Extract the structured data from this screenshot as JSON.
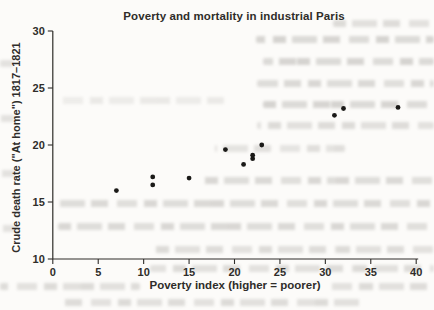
{
  "chart_data": {
    "type": "scatter",
    "title": "Poverty and mortality in industrial Paris",
    "xlabel": "Poverty index (higher = poorer)",
    "ylabel": "Crude death rate (\"At home\") 1817–1821",
    "xlim": [
      0,
      40
    ],
    "ylim": [
      10,
      30
    ],
    "x_ticks": [
      0,
      5,
      10,
      15,
      20,
      25,
      30,
      35,
      40
    ],
    "y_ticks": [
      10,
      15,
      20,
      25,
      30
    ],
    "grid": false,
    "legend": null,
    "marker": "dot",
    "marker_color": "#1b1a18",
    "axis_color": "#2f2d2a",
    "background_color": "#fcfbf9",
    "points": [
      {
        "x": 7,
        "y": 16.0
      },
      {
        "x": 11,
        "y": 16.5
      },
      {
        "x": 11,
        "y": 17.2
      },
      {
        "x": 15,
        "y": 17.1
      },
      {
        "x": 19,
        "y": 19.6
      },
      {
        "x": 21,
        "y": 18.3
      },
      {
        "x": 22,
        "y": 18.8
      },
      {
        "x": 22,
        "y": 19.1
      },
      {
        "x": 23,
        "y": 20.0
      },
      {
        "x": 31,
        "y": 22.6
      },
      {
        "x": 32,
        "y": 23.2
      },
      {
        "x": 38,
        "y": 23.3
      }
    ]
  }
}
